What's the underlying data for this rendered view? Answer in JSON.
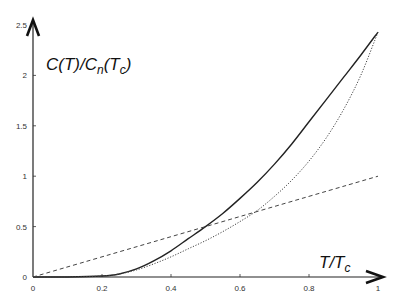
{
  "chart_data": {
    "type": "line",
    "title": "",
    "xlabel": {
      "main": "T/T",
      "sub": "c"
    },
    "ylabel": {
      "parts": [
        {
          "t": "C(T)/C",
          "sub": false
        },
        {
          "t": "n",
          "sub": true
        },
        {
          "t": "(T",
          "sub": false
        },
        {
          "t": "c",
          "sub": true
        },
        {
          "t": ")",
          "sub": false
        }
      ]
    },
    "xlim": [
      0,
      1
    ],
    "ylim": [
      0,
      2.5
    ],
    "x_ticks": [
      0,
      0.2,
      0.4,
      0.6,
      0.8,
      1
    ],
    "x_tick_labels": [
      "0",
      "0.2",
      "0.4",
      "0.6",
      "0.8",
      "1"
    ],
    "y_ticks": [
      0,
      0.5,
      1,
      1.5,
      2,
      2.5
    ],
    "y_tick_labels": [
      "0",
      "0.5",
      "1",
      "1.5",
      "2",
      "2.5"
    ],
    "grid": false,
    "legend": "none",
    "series": [
      {
        "name": "solid",
        "style": "solid",
        "x": [
          0,
          0.1,
          0.2,
          0.25,
          0.3,
          0.35,
          0.4,
          0.45,
          0.5,
          0.55,
          0.6,
          0.65,
          0.7,
          0.75,
          0.8,
          0.85,
          0.9,
          0.95,
          1.0
        ],
        "y": [
          0,
          0,
          0.01,
          0.03,
          0.08,
          0.16,
          0.26,
          0.38,
          0.5,
          0.63,
          0.78,
          0.94,
          1.12,
          1.32,
          1.54,
          1.76,
          1.98,
          2.2,
          2.43
        ]
      },
      {
        "name": "dotted",
        "style": "dotted",
        "x": [
          0,
          0.1,
          0.2,
          0.25,
          0.3,
          0.35,
          0.4,
          0.45,
          0.5,
          0.55,
          0.6,
          0.65,
          0.7,
          0.75,
          0.8,
          0.85,
          0.9,
          0.95,
          1.0
        ],
        "y": [
          0,
          0,
          0.01,
          0.03,
          0.07,
          0.13,
          0.2,
          0.28,
          0.36,
          0.45,
          0.55,
          0.66,
          0.8,
          0.96,
          1.15,
          1.38,
          1.66,
          2.0,
          2.43
        ]
      },
      {
        "name": "dashed",
        "style": "dashed",
        "x": [
          0,
          1.0
        ],
        "y": [
          0,
          1.0
        ]
      }
    ]
  }
}
